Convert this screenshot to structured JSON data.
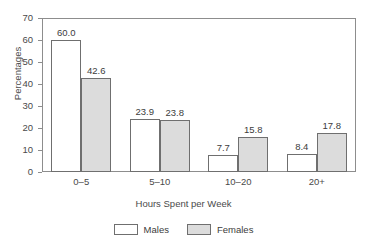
{
  "clipped_header_text": "",
  "chart_data": {
    "type": "bar",
    "title": "",
    "xlabel": "Hours Spent per Week",
    "ylabel": "Percentages",
    "categories": [
      "0–5",
      "5–10",
      "10–20",
      "20+"
    ],
    "series": [
      {
        "name": "Males",
        "color": "#ffffff",
        "border_color": "#6f6f6f",
        "values": [
          60.0,
          23.9,
          7.7,
          8.4
        ],
        "value_labels": [
          "60.0",
          "23.9",
          "7.7",
          "8.4"
        ]
      },
      {
        "name": "Females",
        "color": "#dcdcdc",
        "border_color": "#6f6f6f",
        "values": [
          42.6,
          23.8,
          15.8,
          17.8
        ],
        "value_labels": [
          "42.6",
          "23.8",
          "15.8",
          "17.8"
        ]
      }
    ],
    "ylim": [
      0,
      70
    ],
    "yticks": [
      0,
      10,
      20,
      30,
      40,
      50,
      60,
      70
    ],
    "ytick_labels": [
      "0",
      "10",
      "20",
      "30",
      "40",
      "50",
      "60",
      "70"
    ],
    "grid": false,
    "legend_position": "bottom-center",
    "frame": true
  },
  "legend": {
    "items": [
      {
        "label": "Males",
        "swatch": "males"
      },
      {
        "label": "Females",
        "swatch": "females"
      }
    ]
  }
}
